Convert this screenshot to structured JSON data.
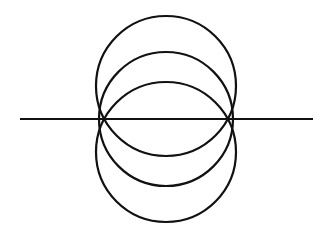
{
  "diagram": {
    "stroke_color": "#111111",
    "background_color": "#ffffff",
    "elements": [
      {
        "type": "line",
        "name": "baseline"
      },
      {
        "type": "circle",
        "name": "upper-circle",
        "position": "center above line"
      },
      {
        "type": "circle",
        "name": "middle-circle",
        "position": "center on line"
      },
      {
        "type": "circle",
        "name": "lower-circle",
        "position": "center below line"
      }
    ],
    "common_points": 2,
    "circle_count": 3
  }
}
